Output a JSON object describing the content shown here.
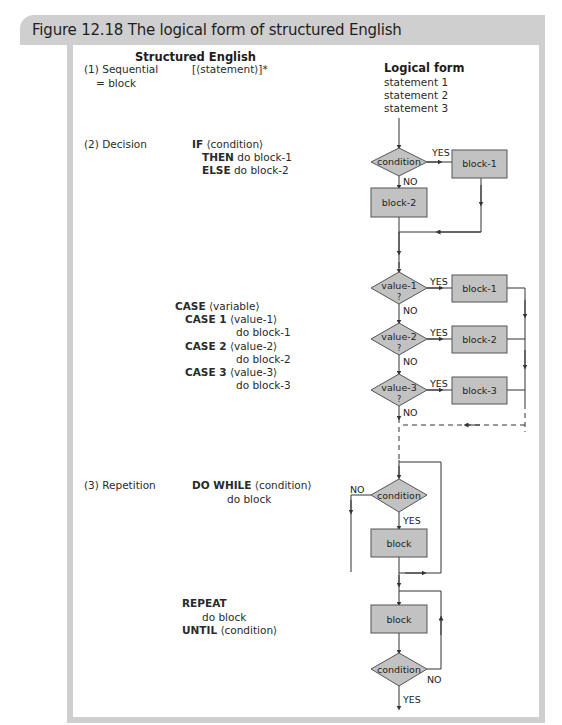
{
  "figure": {
    "title": "Figure 12.18 The logical form of structured English",
    "colors": {
      "frame": "#cfcfcf",
      "node_fill": "#c2c2c2",
      "node_stroke": "#555555",
      "line": "#333333"
    }
  },
  "columns": {
    "left_heading": "Structured English",
    "right_heading": "Logical form"
  },
  "sections": {
    "sequential": {
      "label": "(1) Sequential",
      "sublabel": "= block",
      "syntax": "[⟨statement⟩]*",
      "logical_form": [
        "statement 1",
        "statement 2",
        "statement 3"
      ]
    },
    "decision": {
      "label": "(2) Decision",
      "if_keyword": "IF",
      "if_arg": "⟨condition⟩",
      "then_keyword": "THEN",
      "then_arg": "do block-1",
      "else_keyword": "ELSE",
      "else_arg": "do block-2",
      "diagram": {
        "condition": "condition",
        "yes": "YES",
        "no": "NO",
        "block_yes": "block-1",
        "block_no": "block-2"
      }
    },
    "case": {
      "case_keyword": "CASE",
      "case_arg": "⟨variable⟩",
      "cases": [
        {
          "keyword": "CASE 1",
          "arg": "⟨value-1⟩",
          "action": "do block-1"
        },
        {
          "keyword": "CASE 2",
          "arg": "⟨value-2⟩",
          "action": "do block-2"
        },
        {
          "keyword": "CASE 3",
          "arg": "⟨value-3⟩",
          "action": "do block-3"
        }
      ],
      "diagram": {
        "tests": [
          "value-1",
          "value-2",
          "value-3"
        ],
        "question": "?",
        "blocks": [
          "block-1",
          "block-2",
          "block-3"
        ],
        "yes": "YES",
        "no": "NO"
      }
    },
    "repetition": {
      "label": "(3) Repetition",
      "do_while_keyword": "DO WHILE",
      "do_while_arg": "⟨condition⟩",
      "do_while_body": "do block",
      "do_while_diagram": {
        "condition": "condition",
        "block": "block",
        "yes": "YES",
        "no": "NO"
      },
      "repeat_keyword": "REPEAT",
      "repeat_body": "do block",
      "until_keyword": "UNTIL",
      "until_arg": "⟨condition⟩",
      "repeat_diagram": {
        "condition": "condition",
        "block": "block",
        "yes": "YES",
        "no": "NO"
      }
    }
  }
}
